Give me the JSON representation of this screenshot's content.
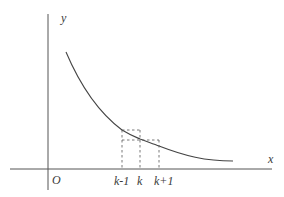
{
  "diagram": {
    "axes": {
      "x_label": "x",
      "y_label": "y",
      "origin_label": "O"
    },
    "tick_labels": [
      {
        "id": "k_minus_1",
        "text": "k-1"
      },
      {
        "id": "k",
        "text": "k"
      },
      {
        "id": "k_plus_1",
        "text": "k+1"
      }
    ],
    "curve": {
      "description": "decreasing convex curve",
      "color": "#444444"
    },
    "rectangles": [
      {
        "description": "dashed rectangle from k-1 to k with height f(k-1)"
      },
      {
        "description": "dashed rectangle from k to k+1 with height f(k)"
      }
    ]
  }
}
